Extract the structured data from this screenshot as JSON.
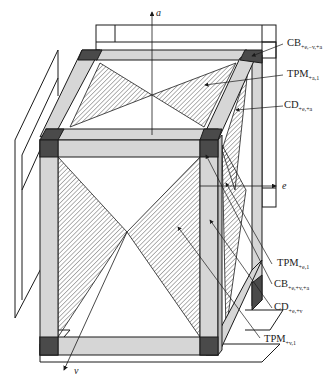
{
  "diagram": {
    "type": "3d-frame-cube",
    "colors": {
      "bar_fill": "#d6d6d6",
      "corner_fill": "#4a4a4a",
      "hatch": "#555555",
      "line": "#1a1a1a",
      "background": "#ffffff"
    },
    "axes": {
      "a": "a",
      "e": "e",
      "v": "v"
    },
    "labels": [
      {
        "id": "cb-top",
        "base": "CB",
        "sub": "+e,−v,+a"
      },
      {
        "id": "tpm-a",
        "base": "TPM",
        "sub": "+a,1"
      },
      {
        "id": "cd-ea",
        "base": "CD",
        "sub": "+e,+a"
      },
      {
        "id": "tpm-e",
        "base": "TPM",
        "sub": "+e,1"
      },
      {
        "id": "cb-front",
        "base": "CB",
        "sub": "+e,+v,+a"
      },
      {
        "id": "cd-ev",
        "base": "CD",
        "sub": "+e,+v"
      },
      {
        "id": "tpm-v",
        "base": "TPM",
        "sub": "+v,1"
      }
    ]
  }
}
